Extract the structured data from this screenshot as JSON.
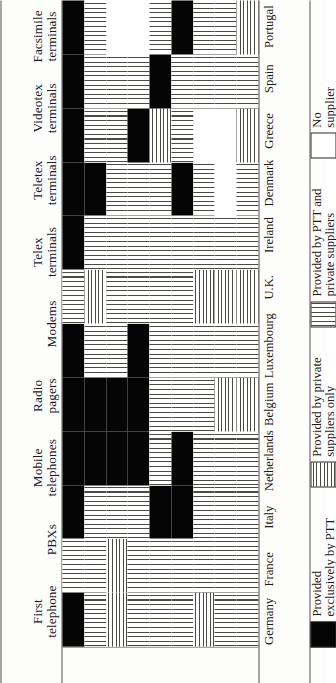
{
  "figure": {
    "orientation": "rotated-90-ccw",
    "row_header_label": "",
    "columns": [
      {
        "id": "first_telephone",
        "line1": "First",
        "line2": "telephone"
      },
      {
        "id": "pbxs",
        "line1": "PBXs",
        "line2": ""
      },
      {
        "id": "mobile_telephones",
        "line1": "Mobile",
        "line2": "telephones"
      },
      {
        "id": "radio_pagers",
        "line1": "Radio",
        "line2": "pagers"
      },
      {
        "id": "modems",
        "line1": "Modems",
        "line2": ""
      },
      {
        "id": "telex_terminals",
        "line1": "Telex",
        "line2": "terminals"
      },
      {
        "id": "teletex_terminals",
        "line1": "Teletex",
        "line2": "terminals"
      },
      {
        "id": "videotex_terminals",
        "line1": "Videotex",
        "line2": "terminals"
      },
      {
        "id": "facsimile_terminals",
        "line1": "Facsimile",
        "line2": "terminals"
      }
    ],
    "rows": [
      "Germany",
      "France",
      "Italy",
      "Netherlands",
      "Belgium",
      "Luxembourg",
      "U.K.",
      "Ireland",
      "Denmark",
      "Greece",
      "Spain",
      "Portugal"
    ]
  },
  "legend": {
    "items": [
      {
        "key": "ptt",
        "swatch": "solid-black",
        "line1": "Provided",
        "line2": "exclusively by PTT"
      },
      {
        "key": "priv",
        "swatch": "vertical-hatch",
        "line1": "Provided by private",
        "line2": "suppliers only"
      },
      {
        "key": "both",
        "swatch": "horizontal-hatch",
        "line1": "Provided by PTT and",
        "line2": "private suppliers"
      },
      {
        "key": "none",
        "swatch": "empty-white",
        "line1": "No",
        "line2": "supplier"
      }
    ]
  },
  "colors": {
    "ink": "#050505",
    "rule": "#55514c",
    "hatch": "#4d4a46",
    "paper": "#fdfdfc",
    "white": "#ffffff"
  },
  "chart_data": {
    "type": "heatmap",
    "title": "",
    "xlabel": "",
    "ylabel": "",
    "legend_position": "bottom",
    "grid": true,
    "value_scale": [
      "ptt",
      "priv",
      "both",
      "none"
    ],
    "value_labels": {
      "ptt": "Provided exclusively by PTT",
      "priv": "Provided by private suppliers only",
      "both": "Provided by PTT and private suppliers",
      "none": "No supplier"
    },
    "categories": [
      "First telephone",
      "PBXs",
      "Mobile telephones",
      "Radio pagers",
      "Modems",
      "Telex terminals",
      "Teletex terminals",
      "Videotex terminals",
      "Facsimile terminals"
    ],
    "rows": [
      "Germany",
      "France",
      "Italy",
      "Netherlands",
      "Belgium",
      "Luxembourg",
      "U.K.",
      "Ireland",
      "Denmark",
      "Greece",
      "Spain",
      "Portugal"
    ],
    "matrix": [
      [
        "ptt",
        "both",
        "priv",
        "both",
        "both",
        "both",
        "priv",
        "both",
        "both"
      ],
      [
        "both",
        "both",
        "priv",
        "both",
        "both",
        "both",
        "both",
        "both",
        "both"
      ],
      [
        "ptt",
        "both",
        "both",
        "both",
        "ptt",
        "ptt",
        "both",
        "both",
        "both"
      ],
      [
        "ptt",
        "ptt",
        "ptt",
        "ptt",
        "both",
        "ptt",
        "both",
        "both",
        "both"
      ],
      [
        "ptt",
        "ptt",
        "ptt",
        "ptt",
        "both",
        "both",
        "both",
        "priv",
        "priv"
      ],
      [
        "ptt",
        "both",
        "both",
        "ptt",
        "both",
        "both",
        "both",
        "both",
        "both"
      ],
      [
        "both",
        "priv",
        "both",
        "both",
        "both",
        "both",
        "priv",
        "priv",
        "priv"
      ],
      [
        "ptt",
        "both",
        "both",
        "both",
        "both",
        "both",
        "both",
        "both",
        "both"
      ],
      [
        "ptt",
        "ptt",
        "both",
        "both",
        "both",
        "ptt",
        "both",
        "none",
        "both"
      ],
      [
        "ptt",
        "both",
        "both",
        "ptt",
        "priv",
        "both",
        "none",
        "none",
        "priv"
      ],
      [
        "ptt",
        "both",
        "both",
        "both",
        "ptt",
        "both",
        "both",
        "both",
        "both"
      ],
      [
        "ptt",
        "both",
        "none",
        "none",
        "both",
        "ptt",
        "both",
        "both",
        "priv"
      ]
    ]
  }
}
